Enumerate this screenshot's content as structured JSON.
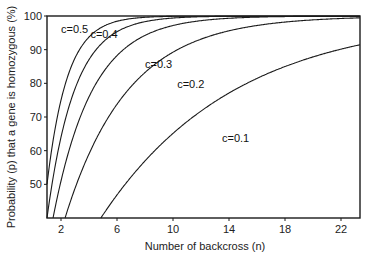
{
  "chart_data": {
    "type": "line",
    "title": "",
    "xlabel": "Number of backcross (n)",
    "ylabel": "Probability (p) that a gene is homozygous (%)",
    "xlim": [
      1,
      23.4
    ],
    "ylim": [
      40,
      100
    ],
    "xticks": [
      2,
      6,
      10,
      14,
      18,
      22
    ],
    "yticks": [
      50,
      60,
      70,
      80,
      90,
      100
    ],
    "grid": false,
    "legend": "inline labels",
    "x": [
      1,
      2,
      3,
      4,
      5,
      6,
      7,
      8,
      9,
      10,
      11,
      12,
      13,
      14,
      15,
      16,
      17,
      18,
      19,
      20,
      21,
      22,
      23
    ],
    "series": [
      {
        "name": "c=0.5",
        "values": [
          50.0,
          75.0,
          87.5,
          93.8,
          96.9,
          98.4,
          99.2,
          99.6,
          99.8,
          99.9,
          100,
          100,
          100,
          100,
          100,
          100,
          100,
          100,
          100,
          100,
          100,
          100,
          100
        ]
      },
      {
        "name": "c=0.4",
        "values": [
          40.0,
          64.0,
          78.4,
          87.0,
          92.2,
          95.3,
          97.2,
          98.3,
          99.0,
          99.4,
          99.6,
          99.8,
          99.9,
          99.9,
          100,
          100,
          100,
          100,
          100,
          100,
          100,
          100,
          100
        ]
      },
      {
        "name": "c=0.3",
        "values": [
          30.0,
          51.0,
          65.7,
          76.0,
          83.2,
          88.2,
          91.8,
          94.2,
          96.0,
          97.2,
          98.0,
          98.6,
          99.0,
          99.3,
          99.5,
          99.7,
          99.8,
          99.8,
          99.9,
          99.9,
          99.9,
          100,
          100
        ]
      },
      {
        "name": "c=0.2",
        "values": [
          20.0,
          36.0,
          48.8,
          59.0,
          67.2,
          73.8,
          79.0,
          83.2,
          86.6,
          89.3,
          91.4,
          93.1,
          94.5,
          95.6,
          96.5,
          97.2,
          97.7,
          98.2,
          98.6,
          98.8,
          99.1,
          99.3,
          99.4
        ]
      },
      {
        "name": "c=0.1",
        "values": [
          10.0,
          19.0,
          27.1,
          34.4,
          41.0,
          46.9,
          52.2,
          57.0,
          61.3,
          65.1,
          68.6,
          71.8,
          74.6,
          77.1,
          79.4,
          81.5,
          83.3,
          85.0,
          86.5,
          87.8,
          89.1,
          90.2,
          91.1
        ]
      }
    ],
    "annotations": [
      {
        "text": "c=0.5",
        "x": 2.0,
        "y": 95
      },
      {
        "text": "c=0.4",
        "x": 4.1,
        "y": 93.5
      },
      {
        "text": "c=0.3",
        "x": 8.0,
        "y": 84.5
      },
      {
        "text": "c=0.2",
        "x": 10.3,
        "y": 78.5
      },
      {
        "text": "c=0.1",
        "x": 13.5,
        "y": 62.5
      }
    ]
  },
  "layout": {
    "plot": {
      "left": 47,
      "right": 360,
      "top": 16,
      "bottom": 218
    },
    "x_px_per_unit": 14,
    "x_origin_px": 33
  }
}
